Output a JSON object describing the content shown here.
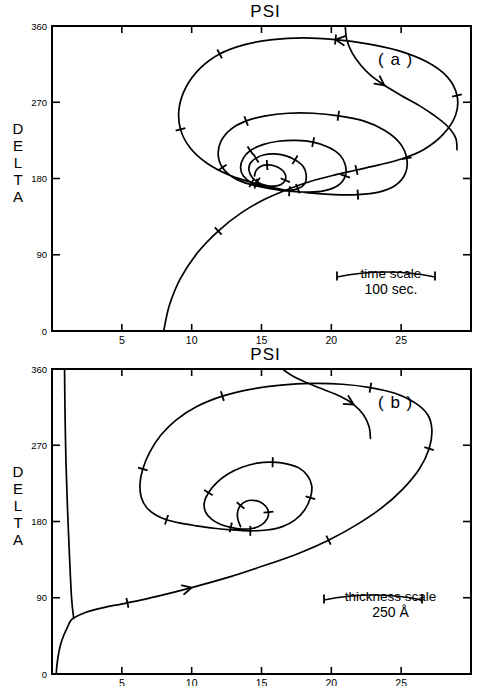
{
  "figure": {
    "axis_title": "PSI",
    "y_axis_label_letters": [
      "D",
      "E",
      "L",
      "T",
      "A"
    ],
    "x_ticks": [
      5,
      10,
      15,
      20,
      25
    ],
    "y_ticks": [
      0,
      90,
      180,
      270,
      360
    ],
    "xlim": [
      0,
      30
    ],
    "ylim": [
      0,
      360
    ]
  },
  "panels": [
    {
      "tag": "( a )",
      "scale": {
        "title": "time scale",
        "value": "100 sec."
      }
    },
    {
      "tag": "( b )",
      "scale": {
        "title": "thickness scale",
        "value": "250 Å"
      }
    }
  ],
  "chart_data": [
    {
      "type": "line",
      "title": "PSI",
      "subtitle": "( a )",
      "xlabel": "PSI",
      "ylabel": "DELTA",
      "xlim": [
        0,
        30
      ],
      "ylim": [
        0,
        360
      ],
      "xticks": [
        5,
        10,
        15,
        20,
        25
      ],
      "yticks": [
        0,
        90,
        180,
        270,
        360
      ],
      "grid": false,
      "legend": null,
      "annotations": [
        {
          "text": "( a )",
          "x": 24.5,
          "y": 315
        },
        {
          "text": "time scale",
          "x": 24.0,
          "y": 95
        },
        {
          "text": "100 sec.",
          "x": 23.8,
          "y": 60
        }
      ],
      "series": [
        {
          "name": "inward-spiral-trajectory-a",
          "comment": "Spiral trajectory converging on focus near PSI=14.5, DELTA=160; tick marks along path mark equal time intervals of 100 sec.",
          "focus": {
            "psi": 14.5,
            "delta": 160
          },
          "x": [
            8.0,
            8.4,
            9.2,
            10.4,
            11.9,
            13.6,
            15.3,
            17.0,
            18.6,
            20.2,
            21.8,
            23.4,
            25.0,
            26.6,
            28.0,
            28.9,
            29.0,
            28.3,
            26.8,
            24.8,
            22.6,
            20.3,
            18.0,
            15.8,
            13.8,
            12.0,
            10.6,
            9.6,
            9.1,
            9.2,
            9.9,
            11.1,
            12.7,
            14.6,
            16.5,
            18.4,
            20.2,
            21.9,
            23.4,
            24.6,
            25.3,
            25.4,
            24.9,
            23.8,
            22.3,
            20.5,
            18.7,
            16.9,
            15.3,
            13.9,
            12.8,
            12.1,
            11.9,
            12.2,
            13.0,
            14.2,
            15.6,
            17.0,
            18.4,
            19.6,
            20.5,
            21.0,
            21.0,
            20.6,
            19.8,
            18.7,
            17.5,
            16.2,
            15.1,
            14.2,
            13.7,
            13.5,
            13.7,
            14.3,
            15.1,
            16.0,
            16.9,
            17.6,
            18.1,
            18.2,
            18.0,
            17.4,
            16.7,
            15.9,
            15.2,
            14.6,
            14.2,
            14.1,
            14.3,
            14.7,
            15.3,
            15.9,
            16.4,
            16.7,
            16.7,
            16.4,
            15.9,
            15.4,
            14.9,
            14.6,
            14.5
          ],
          "y": [
            0,
            30,
            62,
            92,
            118,
            140,
            156,
            168,
            177,
            184,
            190,
            196,
            203,
            214,
            232,
            255,
            278,
            300,
            318,
            331,
            339,
            344,
            346,
            344,
            338,
            327,
            310,
            288,
            263,
            238,
            216,
            198,
            184,
            174,
            167,
            163,
            161,
            161,
            164,
            172,
            186,
            204,
            222,
            237,
            248,
            254,
            257,
            257,
            254,
            248,
            238,
            224,
            208,
            193,
            181,
            173,
            168,
            165,
            164,
            166,
            172,
            183,
            196,
            208,
            217,
            223,
            225,
            224,
            220,
            213,
            204,
            193,
            183,
            175,
            170,
            167,
            166,
            168,
            174,
            184,
            194,
            202,
            207,
            209,
            208,
            204,
            198,
            190,
            182,
            176,
            172,
            171,
            173,
            178,
            185,
            191,
            195,
            196,
            194,
            189,
            183,
            176,
            170,
            165,
            162
          ]
        },
        {
          "name": "upper-right-incoming-branch-a",
          "comment": "Second branch entering from top of frame near PSI=21 with downward arrow",
          "x": [
            21.0,
            21.1,
            21.5,
            22.1,
            22.8,
            23.8,
            25.0,
            26.3,
            27.4,
            28.3,
            28.9,
            29.0
          ],
          "y": [
            360,
            344,
            328,
            314,
            302,
            290,
            278,
            266,
            254,
            242,
            228,
            214
          ]
        }
      ]
    },
    {
      "type": "line",
      "title": "PSI",
      "subtitle": "( b )",
      "xlabel": "PSI",
      "ylabel": "DELTA",
      "xlim": [
        0,
        30
      ],
      "ylim": [
        0,
        360
      ],
      "xticks": [
        5,
        10,
        15,
        20,
        25
      ],
      "yticks": [
        0,
        90,
        180,
        270,
        360
      ],
      "grid": false,
      "legend": null,
      "annotations": [
        {
          "text": "( b )",
          "x": 24.5,
          "y": 315
        },
        {
          "text": "thickness scale",
          "x": 23.5,
          "y": 95
        },
        {
          "text": "250 Å",
          "x": 23.5,
          "y": 60
        }
      ],
      "series": [
        {
          "name": "inward-spiral-trajectory-b",
          "comment": "Spiral trajectory in thickness coordinates; starts at PSI~0.3 DELTA=0, rises near the left axis to DELTA=360, then spirals inward to focus near PSI=13.5, DELTA=158. Ticks mark 250 Angstrom thickness increments.",
          "focus": {
            "psi": 13.5,
            "delta": 158
          },
          "x": [
            0.3,
            0.35,
            0.45,
            0.6,
            0.85,
            1.1,
            1.3,
            1.55,
            2.3,
            3.6,
            5.4,
            7.6,
            10.0,
            12.6,
            15.2,
            17.6,
            19.8,
            21.8,
            23.6,
            25.1,
            26.3,
            27.0,
            27.2,
            26.9,
            26.0,
            24.6,
            22.8,
            20.8,
            18.6,
            16.4,
            14.2,
            12.2,
            10.4,
            8.9,
            7.8,
            7.0,
            6.5,
            6.3,
            6.4,
            6.8,
            7.4,
            8.2,
            9.2,
            10.3,
            11.6,
            12.9,
            14.2,
            15.4,
            16.5,
            17.4,
            18.1,
            18.5,
            18.6,
            18.3,
            17.7,
            16.8,
            15.8,
            14.7,
            13.6,
            12.6,
            11.8,
            11.2,
            10.9,
            11.0,
            11.4,
            12.0,
            12.8,
            13.6,
            14.4,
            15.0,
            15.4,
            15.5,
            15.3,
            14.9,
            14.4,
            13.9,
            13.5,
            13.3,
            13.3,
            13.5
          ],
          "y": [
            0,
            10,
            22,
            34,
            46,
            55,
            62,
            66,
            72,
            78,
            84,
            92,
            102,
            114,
            128,
            142,
            158,
            176,
            196,
            218,
            242,
            266,
            288,
            306,
            320,
            331,
            338,
            342,
            343,
            341,
            336,
            328,
            316,
            300,
            282,
            262,
            242,
            224,
            208,
            196,
            188,
            182,
            178,
            175,
            172,
            170,
            169,
            170,
            174,
            182,
            194,
            208,
            222,
            234,
            243,
            248,
            250,
            249,
            244,
            236,
            226,
            214,
            202,
            191,
            183,
            177,
            173,
            171,
            172,
            176,
            183,
            191,
            198,
            203,
            205,
            204,
            199,
            192,
            183,
            174
          ]
        },
        {
          "name": "left-axis-asymptote-b",
          "comment": "Near-vertical segment hugging left axis from DELTA~280 up to DELTA=360",
          "x": [
            1.55,
            1.4,
            1.25,
            1.1,
            1.0,
            0.95,
            0.92,
            0.9
          ],
          "y": [
            66,
            90,
            140,
            200,
            250,
            290,
            325,
            360
          ]
        },
        {
          "name": "upper-right-incoming-branch-b",
          "comment": "Branch entering from top of frame near PSI=16.5 with downward-left arrow",
          "x": [
            16.5,
            17.2,
            18.2,
            19.4,
            20.6,
            21.6,
            22.3,
            22.7,
            22.8
          ],
          "y": [
            360,
            352,
            344,
            336,
            328,
            318,
            306,
            292,
            278
          ]
        }
      ]
    }
  ]
}
